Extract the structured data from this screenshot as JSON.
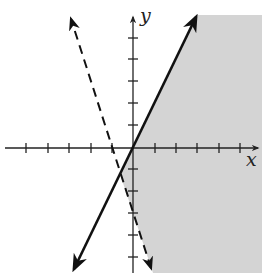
{
  "figure": {
    "type": "system of linear inequalities graph",
    "x_axis_label": "x",
    "y_axis_label": "y",
    "x_ticks": [
      -5,
      -4,
      -3,
      -2,
      -1,
      1,
      2,
      3,
      4,
      5
    ],
    "y_ticks": [
      -6,
      -5,
      -4,
      -3,
      -2,
      -1,
      1,
      2,
      3,
      4,
      5,
      6
    ],
    "lines": [
      {
        "name": "boundary-solid",
        "equation": "y = 2x",
        "style": "solid",
        "color": "#111111"
      },
      {
        "name": "boundary-dashed",
        "equation": "y = -3x - 3",
        "style": "dashed",
        "color": "#111111"
      }
    ],
    "shaded_region": {
      "description": "y <= 2x and y > -3x - 3",
      "color": "#d4d4d4"
    }
  },
  "colors": {
    "background": "#ffffff",
    "shading": "#d4d4d4",
    "ink": "#111111"
  }
}
